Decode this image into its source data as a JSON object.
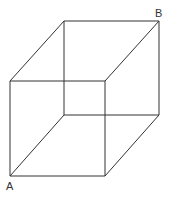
{
  "figure": {
    "type": "wireframe-cube",
    "labels": {
      "A": "A",
      "B": "B"
    },
    "vertices": {
      "front_top_left": [
        10,
        81
      ],
      "front_top_right": [
        105,
        81
      ],
      "front_bottom_left": [
        10,
        176
      ],
      "front_bottom_right": [
        105,
        176
      ],
      "back_top_left": [
        64,
        21
      ],
      "back_top_right": [
        159,
        21
      ],
      "back_bottom_left": [
        64,
        115
      ],
      "back_bottom_right": [
        159,
        115
      ]
    },
    "line_color": "#333333",
    "background": "#ffffff"
  }
}
